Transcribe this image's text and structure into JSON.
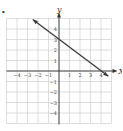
{
  "chart_data": {
    "type": "line",
    "title": "",
    "xlabel": "X",
    "ylabel": "y",
    "xlim": [
      -5,
      5
    ],
    "ylim": [
      -5,
      5
    ],
    "grid": true,
    "x_ticks": [
      -4,
      -3,
      -2,
      -1,
      1,
      2,
      3,
      4
    ],
    "y_ticks": [
      4,
      3,
      2,
      1,
      -1,
      -2,
      -3,
      -4
    ],
    "series": [
      {
        "name": "line",
        "equation": "y = -3/4 x + 3",
        "points": [
          {
            "x": -2.5,
            "y": 4.9
          },
          {
            "x": 0,
            "y": 3
          },
          {
            "x": 4,
            "y": 0
          },
          {
            "x": 4.7,
            "y": -0.5
          }
        ],
        "arrows": "both"
      }
    ],
    "bullet_marker": "•"
  },
  "colors": {
    "grid": "#c8c8c8",
    "axis": "#333333",
    "line": "#3a3a3a"
  }
}
